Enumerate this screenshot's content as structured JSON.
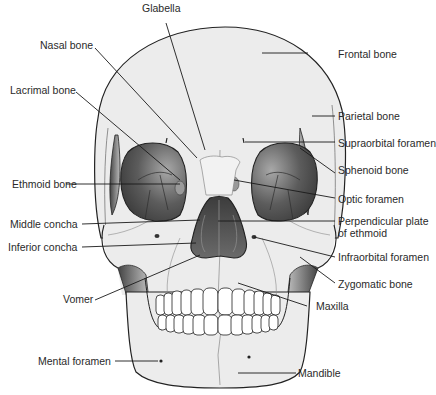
{
  "diagram": {
    "colors": {
      "bone_fill": "#ececec",
      "outline": "#222222",
      "orbit_dark": "#4a4a4a",
      "orbit_light": "#9a9a9a",
      "suture": "#8a8a8a",
      "leader_line": "#1a1a1a",
      "label_text": "#2a2a2a"
    },
    "labels": {
      "glabella": "Glabella",
      "frontal_bone": "Frontal bone",
      "nasal_bone": "Nasal bone",
      "lacrimal_bone": "Lacrimal bone",
      "parietal_bone": "Parietal bone",
      "supraorbital_foramen": "Supraorbital foramen",
      "sphenoid_bone": "Sphenoid bone",
      "ethmoid_bone": "Ethmoid bone",
      "optic_foramen": "Optic foramen",
      "middle_concha": "Middle concha",
      "perpendicular_plate_line1": "Perpendicular plate",
      "perpendicular_plate_line2": "of ethmoid",
      "inferior_concha": "Inferior concha",
      "infraorbital_foramen": "Infraorbital foramen",
      "zygomatic_bone": "Zygomatic bone",
      "vomer": "Vomer",
      "maxilla": "Maxilla",
      "mental_foramen": "Mental foramen",
      "mandible": "Mandible"
    }
  }
}
